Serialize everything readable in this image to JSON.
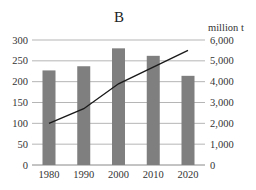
{
  "chart_data": {
    "type": "bar",
    "title": "B",
    "xlabel": "",
    "ylabel": "",
    "y2label": "million t",
    "categories": [
      "1980",
      "1990",
      "2000",
      "2010",
      "2020"
    ],
    "series": [
      {
        "name": "bars (left axis)",
        "type": "bar",
        "axis": "left",
        "values": [
          227,
          237,
          280,
          262,
          214
        ],
        "color": "#7f7f7f"
      },
      {
        "name": "line (right axis, million t)",
        "type": "line",
        "axis": "right",
        "values": [
          2000,
          2700,
          3900,
          4700,
          5500
        ],
        "color": "#1a1a1a"
      }
    ],
    "ylim": [
      0,
      300
    ],
    "y2lim": [
      0,
      6000
    ],
    "yticks": [
      "0",
      "50",
      "100",
      "150",
      "200",
      "250",
      "300"
    ],
    "y2ticks": [
      "0",
      "1,000",
      "2,000",
      "3,000",
      "4,000",
      "5,000",
      "6,000"
    ],
    "grid": true,
    "legend": null
  }
}
